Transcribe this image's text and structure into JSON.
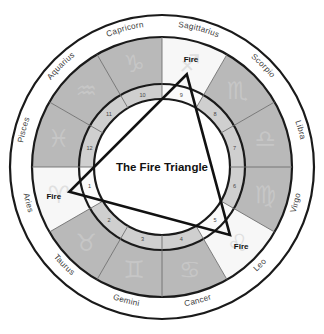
{
  "figure": {
    "title": "The Fire Triangle",
    "center_label": "The Fire Triangle",
    "element_label": "Fire"
  },
  "colors": {
    "ring_stroke": "#1a1a1a",
    "sector_gray": "#b9b9b9",
    "sector_white": "#f7f7f7",
    "band_background": "#ffffff",
    "divider": "#6f6f6f",
    "triangle_stroke": "#111111",
    "glyph": "#c9c9c9",
    "text": "#3b3b3b",
    "title_text": "#111111"
  },
  "chart_data": {
    "type": "pie",
    "title": "The Fire Triangle",
    "subtitle": "",
    "xlabel": "",
    "ylabel": "",
    "legend_position": "none",
    "grid": false,
    "sector_count": 12,
    "sector_degrees": 30,
    "order_direction": "counterclockwise",
    "start_sign": "Aries",
    "start_angle_deg": 180,
    "categories": [
      "Aries",
      "Taurus",
      "Gemini",
      "Cancer",
      "Leo",
      "Virgo",
      "Libra",
      "Scorpio",
      "Sagittarius",
      "Capricorn",
      "Aquarius",
      "Pisces"
    ],
    "values": [
      30,
      30,
      30,
      30,
      30,
      30,
      30,
      30,
      30,
      30,
      30,
      30
    ],
    "signs": [
      {
        "index": 0,
        "label": "Aries",
        "glyph": "♈",
        "element": "Fire",
        "shade": "white",
        "house": 1,
        "mid_angle_deg": 195,
        "fire_vertex": true,
        "fire_label": "Fire"
      },
      {
        "index": 1,
        "label": "Taurus",
        "glyph": "♉",
        "element": "Earth",
        "shade": "gray",
        "house": 2,
        "mid_angle_deg": 225,
        "fire_vertex": false,
        "fire_label": ""
      },
      {
        "index": 2,
        "label": "Gemini",
        "glyph": "♊",
        "element": "Air",
        "shade": "gray",
        "house": 3,
        "mid_angle_deg": 255,
        "fire_vertex": false,
        "fire_label": ""
      },
      {
        "index": 3,
        "label": "Cancer",
        "glyph": "♋",
        "element": "Water",
        "shade": "gray",
        "house": 4,
        "mid_angle_deg": 285,
        "fire_vertex": false,
        "fire_label": ""
      },
      {
        "index": 4,
        "label": "Leo",
        "glyph": "♌",
        "element": "Fire",
        "shade": "white",
        "house": 5,
        "mid_angle_deg": 315,
        "fire_vertex": true,
        "fire_label": "Fire"
      },
      {
        "index": 5,
        "label": "Virgo",
        "glyph": "♍",
        "element": "Earth",
        "shade": "gray",
        "house": 6,
        "mid_angle_deg": 345,
        "fire_vertex": false,
        "fire_label": ""
      },
      {
        "index": 6,
        "label": "Libra",
        "glyph": "♎",
        "element": "Air",
        "shade": "gray",
        "house": 7,
        "mid_angle_deg": 15,
        "fire_vertex": false,
        "fire_label": ""
      },
      {
        "index": 7,
        "label": "Scorpio",
        "glyph": "♏",
        "element": "Water",
        "shade": "gray",
        "house": 8,
        "mid_angle_deg": 45,
        "fire_vertex": false,
        "fire_label": ""
      },
      {
        "index": 8,
        "label": "Sagittarius",
        "glyph": "♐",
        "element": "Fire",
        "shade": "white",
        "house": 9,
        "mid_angle_deg": 75,
        "fire_vertex": true,
        "fire_label": "Fire"
      },
      {
        "index": 9,
        "label": "Capricorn",
        "glyph": "♑",
        "element": "Earth",
        "shade": "gray",
        "house": 10,
        "mid_angle_deg": 105,
        "fire_vertex": false,
        "fire_label": ""
      },
      {
        "index": 10,
        "label": "Aquarius",
        "glyph": "♒",
        "element": "Air",
        "shade": "gray",
        "house": 11,
        "mid_angle_deg": 135,
        "fire_vertex": false,
        "fire_label": ""
      },
      {
        "index": 11,
        "label": "Pisces",
        "glyph": "♓",
        "element": "Water",
        "shade": "gray",
        "house": 12,
        "mid_angle_deg": 165,
        "fire_vertex": false,
        "fire_label": ""
      }
    ],
    "house_numbers": [
      "1",
      "2",
      "3",
      "4",
      "5",
      "6",
      "7",
      "8",
      "9",
      "10",
      "11",
      "12"
    ],
    "triangle": {
      "name": "Fire Triangle",
      "vertex_signs": [
        "Aries",
        "Leo",
        "Sagittarius"
      ],
      "vertex_houses": [
        1,
        5,
        9
      ],
      "aspect": "trine",
      "aspect_degrees": 120,
      "vertex_labels": [
        "Fire",
        "Fire",
        "Fire"
      ]
    },
    "geometry": {
      "center_x": 162,
      "center_y": 167,
      "r_outer": 152,
      "r_label_inner": 130,
      "r_sector_inner": 83,
      "r_house_inner": 68,
      "r_glyph": 107,
      "r_house_text": 75,
      "r_label_text": 141,
      "r_triangle_vertex": 96,
      "r_fire_text": 112
    }
  }
}
